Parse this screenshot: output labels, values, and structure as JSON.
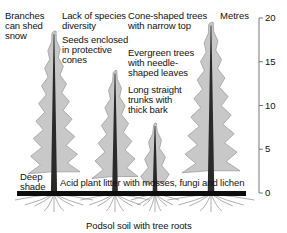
{
  "diagram": {
    "colors": {
      "foliage": "#c8c8c8",
      "foliage_edge": "#8a8a8a",
      "trunk": "#2a2a2a",
      "ground": "#0d0d0d",
      "roots": "#9a9a9a",
      "scale_line": "#555555"
    },
    "labels": {
      "branches_snow": "Branches\ncan shed\nsnow",
      "species_diversity": "Lack of species\ndiversity",
      "seeds": "Seeds enclosed\nin protective\ncones",
      "cone_shaped": "Cone-shaped trees\nwith narrow top",
      "evergreen": "Evergreen trees\nwith needle-\nshaped leaves",
      "trunks": "Long straight\ntrunks with\nthick bark",
      "deep_shade": "Deep\nshade",
      "litter": "Acid plant litter with mosses, fungi and lichen",
      "soil": "Podsol soil with tree roots"
    },
    "scale": {
      "unit_label": "Metres",
      "ticks": [
        20,
        15,
        10,
        5,
        0
      ]
    },
    "trees": [
      {
        "name": "tree-left",
        "height_m": 18.5
      },
      {
        "name": "tree-center-left",
        "height_m": 14
      },
      {
        "name": "tree-small",
        "height_m": 8
      },
      {
        "name": "tree-right",
        "height_m": 19.5
      }
    ]
  }
}
